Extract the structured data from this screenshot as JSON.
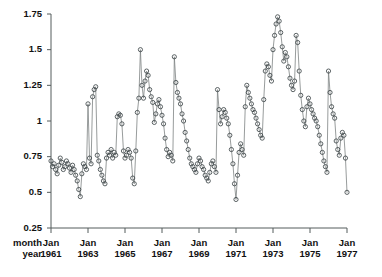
{
  "chart_data": {
    "type": "line",
    "title": "",
    "xlabel": "",
    "ylabel": "",
    "grid": false,
    "legend": "none",
    "marker": "open-circle",
    "row_labels": [
      "month",
      "year"
    ],
    "ylim": [
      0.25,
      1.75
    ],
    "yticks": [
      0.25,
      0.5,
      0.75,
      1,
      1.25,
      1.5,
      1.75
    ],
    "ytick_labels": [
      "0.25",
      "0.5",
      "0.75",
      "1",
      "1.25",
      "1.5",
      "1.75"
    ],
    "xlim": [
      "1961-01",
      "1977-01"
    ],
    "xticks": [
      "1961-01",
      "1963-01",
      "1965-01",
      "1967-01",
      "1969-01",
      "1971-01",
      "1973-01",
      "1975-01",
      "1977-01"
    ],
    "xtick_month_labels": [
      "Jan",
      "Jan",
      "Jan",
      "Jan",
      "Jan",
      "Jan",
      "Jan",
      "Jan",
      "Jan"
    ],
    "xtick_year_labels": [
      "1961",
      "1963",
      "1965",
      "1967",
      "1969",
      "1971",
      "1973",
      "1975",
      "1977"
    ],
    "x_start": "1961-01",
    "x_step_months": 1,
    "series": [
      {
        "name": "series-1",
        "color": "#40484a",
        "values": [
          0.72,
          0.68,
          0.7,
          0.66,
          0.63,
          0.69,
          0.74,
          0.71,
          0.66,
          0.68,
          0.72,
          0.7,
          0.67,
          0.64,
          0.69,
          0.66,
          0.62,
          0.58,
          0.52,
          0.47,
          0.63,
          0.7,
          0.68,
          0.66,
          1.12,
          0.74,
          0.7,
          1.17,
          1.22,
          1.24,
          0.76,
          0.72,
          0.66,
          0.62,
          0.58,
          0.56,
          0.74,
          0.78,
          0.76,
          0.8,
          0.74,
          0.78,
          0.76,
          1.03,
          1.05,
          1.04,
          0.98,
          0.79,
          0.74,
          0.76,
          0.8,
          0.78,
          0.74,
          0.6,
          0.56,
          0.79,
          1.06,
          1.16,
          1.5,
          1.25,
          1.16,
          1.28,
          1.35,
          1.32,
          1.22,
          1.17,
          1.13,
          0.99,
          1.05,
          1.12,
          1.15,
          1.1,
          1.04,
          0.98,
          0.88,
          0.8,
          0.75,
          0.78,
          0.76,
          0.72,
          1.45,
          1.27,
          1.2,
          1.16,
          1.12,
          1.05,
          1.0,
          0.92,
          0.86,
          0.8,
          0.74,
          0.7,
          0.68,
          0.66,
          0.64,
          0.7,
          0.74,
          0.72,
          0.68,
          0.66,
          0.62,
          0.6,
          0.58,
          0.64,
          0.7,
          0.72,
          0.68,
          0.64,
          1.22,
          1.08,
          0.98,
          1.03,
          1.08,
          1.06,
          1.02,
          0.98,
          0.9,
          0.8,
          0.7,
          0.56,
          0.45,
          0.62,
          0.78,
          0.84,
          0.8,
          0.76,
          1.1,
          1.25,
          1.2,
          1.16,
          1.12,
          1.08,
          1.06,
          1.02,
          0.98,
          0.94,
          0.9,
          0.88,
          1.15,
          1.35,
          1.4,
          1.38,
          1.32,
          1.28,
          1.5,
          1.6,
          1.68,
          1.73,
          1.7,
          1.62,
          1.52,
          1.42,
          1.48,
          1.45,
          1.38,
          1.3,
          1.25,
          1.22,
          1.28,
          1.6,
          1.55,
          1.35,
          1.18,
          1.08,
          1.0,
          0.96,
          1.1,
          1.16,
          1.12,
          1.08,
          1.05,
          1.02,
          1.0,
          0.96,
          0.9,
          0.84,
          0.78,
          0.72,
          0.68,
          0.64,
          1.35,
          1.2,
          1.1,
          1.05,
          1.02,
          0.86,
          0.8,
          0.76,
          0.88,
          0.92,
          0.9,
          0.74,
          0.5
        ]
      }
    ]
  }
}
